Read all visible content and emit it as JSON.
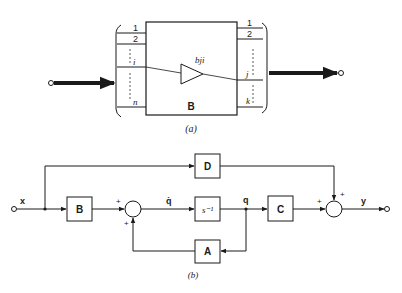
{
  "figure_a": {
    "caption": "(a)",
    "block_label": "B",
    "gain_label": "bji",
    "input_ports": [
      "1",
      "2",
      "i",
      "n"
    ],
    "output_ports": [
      "1",
      "2",
      "j",
      "k"
    ]
  },
  "figure_b": {
    "caption": "(b)",
    "input_signal": "x",
    "output_signal": "y",
    "state_derivative": "q̇",
    "state": "q",
    "blocks": {
      "B": "B",
      "integrator": "s⁻¹",
      "C": "C",
      "D": "D",
      "A": "A"
    },
    "sum1_signs": [
      "+",
      "+"
    ],
    "sum2_signs": [
      "+",
      "+"
    ]
  },
  "colors": {
    "ink": "#1a1a1a",
    "background": "#ffffff"
  }
}
